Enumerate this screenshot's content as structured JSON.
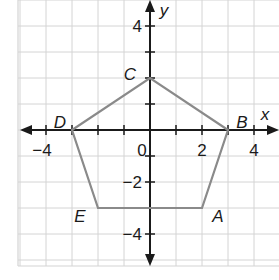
{
  "diagram": {
    "type": "coordinate-plane-polygon",
    "axes": {
      "x_label": "x",
      "y_label": "y",
      "x_range": [
        -5,
        4.8
      ],
      "y_range": [
        -5.2,
        5
      ],
      "x_tick_labels": [
        {
          "value": -4,
          "text": "−4"
        },
        {
          "value": 0,
          "text": "0"
        },
        {
          "value": 2,
          "text": "2"
        },
        {
          "value": 4,
          "text": "4"
        }
      ],
      "y_tick_labels": [
        {
          "value": 4,
          "text": "4"
        },
        {
          "value": -2,
          "text": "−2"
        },
        {
          "value": -4,
          "text": "−4"
        }
      ]
    },
    "polygon": {
      "vertices": [
        {
          "name": "A",
          "x": 2,
          "y": -3
        },
        {
          "name": "B",
          "x": 3,
          "y": 0
        },
        {
          "name": "C",
          "x": 0,
          "y": 2
        },
        {
          "name": "D",
          "x": -3,
          "y": 0
        },
        {
          "name": "E",
          "x": -2,
          "y": -3
        }
      ],
      "stroke_color": "#8a8a8a"
    },
    "colors": {
      "grid": "#d4d4d4",
      "axis": "#1a1a1a",
      "polygon": "#8a8a8a"
    }
  }
}
